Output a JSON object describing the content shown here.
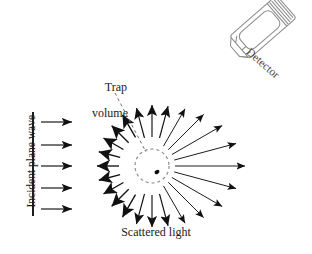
{
  "figure": {
    "width": 312,
    "height": 254,
    "background_color": "#ffffff",
    "ink_color": "#111111",
    "detector_color": "#8d8d8d"
  },
  "labels": {
    "incident_plane_wave": "Incident plane wave",
    "trap_volume_line1": "Trap",
    "trap_volume_line2": "volume",
    "scattered_light": "Scattered light",
    "detector": "Detector"
  },
  "incident_wave": {
    "wavefront_line": {
      "x": 33,
      "y1": 112,
      "y2": 216
    },
    "arrow_count": 5,
    "arrows": [
      {
        "x1": 41,
        "y1": 122,
        "x2": 72,
        "y2": 122
      },
      {
        "x1": 41,
        "y1": 145,
        "x2": 72,
        "y2": 145
      },
      {
        "x1": 41,
        "y1": 166,
        "x2": 72,
        "y2": 166
      },
      {
        "x1": 41,
        "y1": 188,
        "x2": 72,
        "y2": 188
      },
      {
        "x1": 41,
        "y1": 209,
        "x2": 72,
        "y2": 209
      }
    ]
  },
  "trap": {
    "center_x": 152,
    "center_y": 166,
    "radius": 17,
    "dash_pattern": "3 3",
    "particle": {
      "x": 157,
      "y": 172,
      "rx": 2.6,
      "ry": 1.9
    },
    "leader_line": {
      "x1": 115,
      "y1": 93,
      "x2": 146,
      "y2": 152
    }
  },
  "chart_data": {
    "type": "scatter",
    "angle_unit": "degrees",
    "angle_convention": "0 = forward (+x, to the right), measured counter-clockwise",
    "scattered_arrows": [
      {
        "angle": 0,
        "length": 72,
        "weight": "thin"
      },
      {
        "angle": 15,
        "length": 66,
        "weight": "thin"
      },
      {
        "angle": 30,
        "length": 60,
        "weight": "thin"
      },
      {
        "angle": 45,
        "length": 52,
        "weight": "thin"
      },
      {
        "angle": 60,
        "length": 45,
        "weight": "thin"
      },
      {
        "angle": 75,
        "length": 41,
        "weight": "medium"
      },
      {
        "angle": 90,
        "length": 40,
        "weight": "medium"
      },
      {
        "angle": 105,
        "length": 39,
        "weight": "medium"
      },
      {
        "angle": 120,
        "length": 38,
        "weight": "fat"
      },
      {
        "angle": 135,
        "length": 36,
        "weight": "fat"
      },
      {
        "angle": 150,
        "length": 35,
        "weight": "fat"
      },
      {
        "angle": 165,
        "length": 34,
        "weight": "fat"
      },
      {
        "angle": 180,
        "length": 34,
        "weight": "fat"
      },
      {
        "angle": 195,
        "length": 34,
        "weight": "fat"
      },
      {
        "angle": 210,
        "length": 35,
        "weight": "fat"
      },
      {
        "angle": 225,
        "length": 36,
        "weight": "fat"
      },
      {
        "angle": 240,
        "length": 38,
        "weight": "fat"
      },
      {
        "angle": 255,
        "length": 39,
        "weight": "medium"
      },
      {
        "angle": 270,
        "length": 40,
        "weight": "medium"
      },
      {
        "angle": 285,
        "length": 41,
        "weight": "medium"
      },
      {
        "angle": 300,
        "length": 45,
        "weight": "thin"
      },
      {
        "angle": 315,
        "length": 52,
        "weight": "thin"
      },
      {
        "angle": 330,
        "length": 60,
        "weight": "thin"
      },
      {
        "angle": 345,
        "length": 66,
        "weight": "thin"
      }
    ]
  },
  "detector": {
    "rotation_deg": -41,
    "body": {
      "x": 232,
      "y": 12,
      "w": 62,
      "h": 30
    },
    "ridge_count": 5
  }
}
